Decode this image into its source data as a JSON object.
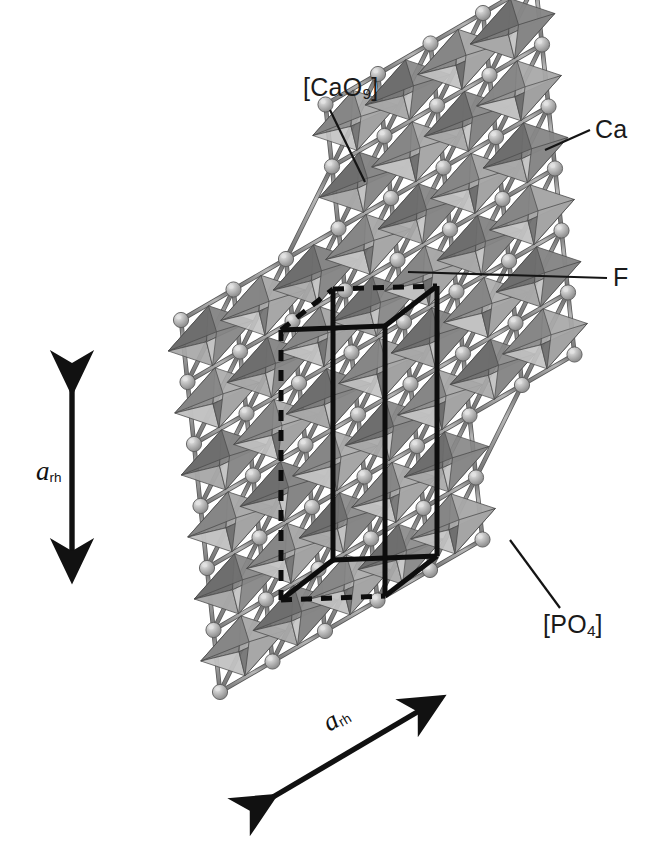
{
  "figure": {
    "kind": "crystal-structure-diagram",
    "background_color": "#ffffff",
    "width": 659,
    "height": 846
  },
  "annotations": {
    "cao9": {
      "text": "[CaO9]",
      "base": "[CaO",
      "sub": "9",
      "tail": "]"
    },
    "ca": {
      "text": "Ca"
    },
    "f": {
      "text": "F"
    },
    "po4": {
      "text": "[PO4]",
      "base": "[PO",
      "sub": "4",
      "tail": "]"
    }
  },
  "axes": {
    "vertical": {
      "base": "a",
      "sub": "rh"
    },
    "diagonal": {
      "base": "a",
      "sub": "rh"
    }
  },
  "palette": {
    "polyhedron_dark": "#6e6e6e",
    "polyhedron_mid": "#868686",
    "polyhedron_light": "#a8a8a8",
    "polyhedron_pale": "#c2c2c2",
    "polyhedron_edge": "#4a4a4a",
    "sphere_fill": "#b4b4b4",
    "sphere_highlight": "#e2e2e2",
    "sphere_edge": "#5c5c5c",
    "bond_rod": "#8f8f8f",
    "bond_rod_edge": "#585858",
    "cell_edge": "#0d0d0d",
    "leader_line": "#141414",
    "arrow": "#111111",
    "text": "#1a1a1a"
  },
  "chart_data": {
    "type": "scatter",
    "title": "",
    "xlabel": "",
    "ylabel": "",
    "note": "3D ball-and-stick plus polyhedral rendering of an apatite lattice viewed along a rhombohedral direction",
    "legend": [
      "[CaO9]",
      "Ca",
      "F",
      "[PO4]"
    ],
    "lattice": {
      "origin_x": 168,
      "origin_y": 196,
      "vec_u": [
        52.5,
        -30.5
      ],
      "vec_v": [
        6.5,
        62.0
      ],
      "cols": 8,
      "rows": 9
    },
    "cell_edges": [
      {
        "x1": 333,
        "y1": 289,
        "x2": 333,
        "y2": 560,
        "style": "solid"
      },
      {
        "x1": 437,
        "y1": 286,
        "x2": 437,
        "y2": 556,
        "style": "solid"
      },
      {
        "x1": 333,
        "y1": 289,
        "x2": 437,
        "y2": 286,
        "style": "dashed"
      },
      {
        "x1": 333,
        "y1": 560,
        "x2": 437,
        "y2": 556,
        "style": "solid"
      },
      {
        "x1": 281,
        "y1": 330,
        "x2": 281,
        "y2": 600,
        "style": "dashed"
      },
      {
        "x1": 281,
        "y1": 600,
        "x2": 333,
        "y2": 560,
        "style": "solid"
      },
      {
        "x1": 281,
        "y1": 330,
        "x2": 333,
        "y2": 289,
        "style": "dashed"
      },
      {
        "x1": 385,
        "y1": 326,
        "x2": 385,
        "y2": 596,
        "style": "solid"
      },
      {
        "x1": 385,
        "y1": 596,
        "x2": 437,
        "y2": 556,
        "style": "solid"
      },
      {
        "x1": 385,
        "y1": 326,
        "x2": 437,
        "y2": 286,
        "style": "solid"
      },
      {
        "x1": 281,
        "y1": 600,
        "x2": 385,
        "y2": 596,
        "style": "dashed"
      },
      {
        "x1": 281,
        "y1": 330,
        "x2": 385,
        "y2": 326,
        "style": "solid"
      }
    ],
    "leaders": [
      {
        "name": "cao9",
        "x1": 330,
        "y1": 110,
        "x2": 365,
        "y2": 182
      },
      {
        "name": "ca",
        "x1": 590,
        "y1": 130,
        "x2": 545,
        "y2": 150
      },
      {
        "name": "f",
        "x1": 607,
        "y1": 278,
        "x2": 408,
        "y2": 272
      },
      {
        "name": "po4",
        "x1": 560,
        "y1": 608,
        "x2": 510,
        "y2": 540
      }
    ],
    "arrows": [
      {
        "name": "a-vertical",
        "x1": 72,
        "y1": 390,
        "x2": 72,
        "y2": 578
      },
      {
        "name": "a-diagonal",
        "x1": 273,
        "y1": 797,
        "x2": 441,
        "y2": 698
      }
    ]
  }
}
